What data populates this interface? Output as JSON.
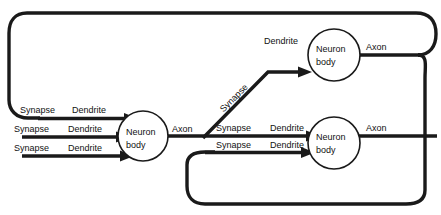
{
  "diagram": {
    "colors": {
      "line": "#1a1a1a",
      "background": "#ffffff",
      "text": "#111111"
    },
    "labels": {
      "synapse": "Synapse",
      "dendrite": "Dendrite",
      "axon": "Axon",
      "soma_line1": "Neuron",
      "soma_line2": "body"
    },
    "neurons": [
      {
        "id": "left",
        "line1": "Neuron",
        "line2": "body",
        "inputs": [
          {
            "synapse": "Synapse",
            "dendrite": "Dendrite"
          },
          {
            "synapse": "Synapse",
            "dendrite": "Dendrite"
          },
          {
            "synapse": "Synapse",
            "dendrite": "Dendrite"
          }
        ],
        "output": "Axon"
      },
      {
        "id": "top-right",
        "line1": "Neuron",
        "line2": "body",
        "inputs": [
          {
            "synapse": "Synapse",
            "dendrite": "Dendrite"
          }
        ],
        "output": "Axon"
      },
      {
        "id": "bottom-right",
        "line1": "Neuron",
        "line2": "body",
        "inputs": [
          {
            "synapse": "Synapse",
            "dendrite": "Dendrite"
          },
          {
            "synapse": "Synapse",
            "dendrite": "Dendrite"
          }
        ],
        "output": "Axon"
      }
    ]
  }
}
